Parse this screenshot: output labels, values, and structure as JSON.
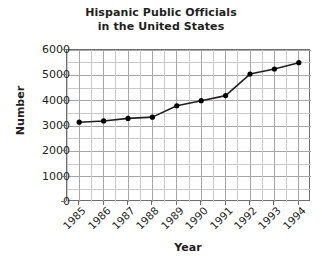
{
  "chart_data": {
    "type": "line",
    "title": "Hispanic Public Officials in the United States",
    "title_lines": [
      "Hispanic Public Officials",
      "in the United States"
    ],
    "xlabel": "Year",
    "ylabel": "Number",
    "categories": [
      "1985",
      "1986",
      "1987",
      "1988",
      "1989",
      "1990",
      "1991",
      "1992",
      "1993",
      "1994"
    ],
    "values": [
      3150,
      3200,
      3300,
      3350,
      3800,
      4000,
      4200,
      5050,
      5250,
      5500
    ],
    "series": [
      {
        "name": "Hispanic public officials",
        "values": [
          3150,
          3200,
          3300,
          3350,
          3800,
          4000,
          4200,
          5050,
          5250,
          5500
        ]
      }
    ],
    "ylim": [
      0,
      6000
    ],
    "ytick_labels": [
      "0",
      "1000",
      "2000",
      "3000",
      "4000",
      "5000",
      "6000"
    ],
    "ytick_values": [
      0,
      1000,
      2000,
      3000,
      4000,
      5000,
      6000
    ],
    "xtick_labels": [
      "1985",
      "1986",
      "1987",
      "1988",
      "1989",
      "1990",
      "1991",
      "1992",
      "1993",
      "1994"
    ],
    "grid": true,
    "minor_grid": true,
    "legend": false,
    "legend_position": "none",
    "marker": "filled-circle",
    "line_color": "#231f20",
    "marker_color": "#000000",
    "grid_color": "#a6a6a6",
    "axis_color": "#6f6f6f",
    "text_color": "#231f20",
    "background": "#ffffff"
  }
}
